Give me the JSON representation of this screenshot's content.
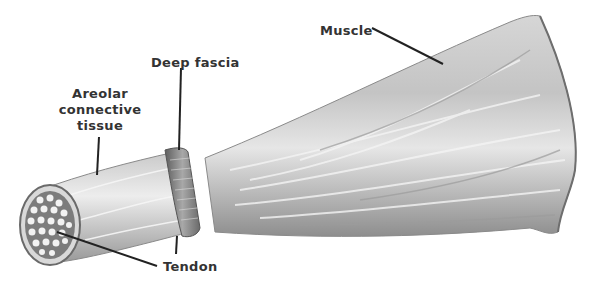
{
  "figure": {
    "type": "anatomical-illustration",
    "labels": {
      "muscle": "Muscle",
      "deep_fascia": "Deep fascia",
      "areolar_line1": "Areolar",
      "areolar_line2": "connective",
      "areolar_line3": "tissue",
      "tendon": "Tendon"
    },
    "colors": {
      "background": "#ffffff",
      "label_text": "#333333",
      "leader_line": "#222222",
      "muscle_fill": "#b8b8b8",
      "muscle_shadow": "#8a8a8a",
      "sheath_fill": "#e2e2e2",
      "fascia_band": "#7a7a7a"
    }
  }
}
